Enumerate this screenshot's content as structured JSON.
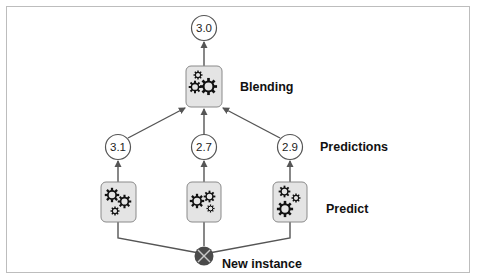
{
  "diagram": {
    "final_output": {
      "value": "3.0"
    },
    "blender": {
      "label": "Blending",
      "icon": "gears-icon"
    },
    "predictions": {
      "label": "Predictions",
      "values": [
        "3.1",
        "2.7",
        "2.9"
      ]
    },
    "predictors": {
      "label": "Predict",
      "count": 3,
      "icon": "gears-icon"
    },
    "input": {
      "label": "New instance",
      "icon": "x-circle-icon"
    },
    "colors": {
      "box_fill": "#e4e4e4",
      "box_stroke": "#8a8a8a",
      "edge": "#555555",
      "instance_fill": "#4a4a4a",
      "instance_x": "#c8c8c8",
      "frame": "#bdbdbd"
    }
  }
}
